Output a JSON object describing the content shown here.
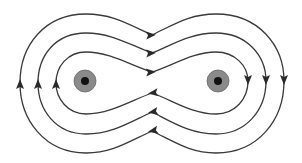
{
  "diagram": {
    "title": "",
    "colors": {
      "line": "#3a3a3a",
      "arrow": "#2a2a2a",
      "conductor_ring": "#8a8a8a",
      "conductor_core": "#111111",
      "background": "#ffffff"
    },
    "conductors": [
      {
        "id": "left",
        "cx": 85,
        "cy": 81,
        "ring_r": 11,
        "core_r": 4,
        "symbol": "dot (current out of page)"
      },
      {
        "id": "right",
        "cx": 218,
        "cy": 81,
        "ring_r": 11,
        "core_r": 4,
        "symbol": "dot (current out of page)"
      }
    ],
    "field_loops": [
      {
        "id": "inner",
        "direction": "clockwise",
        "arrows": [
          "top: right",
          "right: down",
          "bottom: left",
          "left: up"
        ]
      },
      {
        "id": "middle",
        "direction": "clockwise",
        "arrows": [
          "top: right",
          "right: down",
          "bottom: left",
          "left: up"
        ]
      },
      {
        "id": "outer",
        "direction": "clockwise",
        "arrows": [
          "top: right",
          "right: down",
          "bottom: left",
          "left: up"
        ]
      }
    ],
    "labels": []
  }
}
